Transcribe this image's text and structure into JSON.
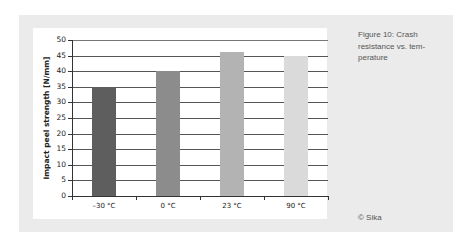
{
  "chart_data": {
    "type": "bar",
    "title": "",
    "xlabel": "",
    "ylabel": "Impact peel strength [N/mm]",
    "categories": [
      "–30 °C",
      "0 °C",
      "23 °C",
      "90 °C"
    ],
    "values": [
      35,
      40,
      46,
      45
    ],
    "colors": [
      "#5e5e5e",
      "#8c8c8c",
      "#b3b3b3",
      "#dadada"
    ],
    "ylim": [
      0,
      50
    ],
    "yticks": [
      0,
      5,
      10,
      15,
      20,
      25,
      30,
      35,
      40,
      45,
      50
    ],
    "grid": true,
    "legend": null
  },
  "caption": {
    "line1": "Figure 10: Crash",
    "line2": "resistance vs. tem-",
    "line3": "perature"
  },
  "credit": "© Sika"
}
